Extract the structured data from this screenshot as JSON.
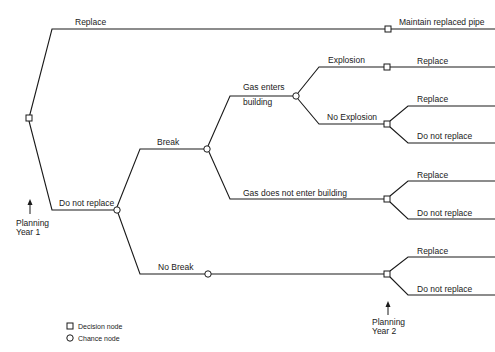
{
  "diagram": {
    "type": "decision-tree",
    "root": {
      "node_type": "decision",
      "branches": [
        {
          "label": "Replace",
          "outcome": {
            "node_type": "decision",
            "terminal_label": "Maintain replaced pipe"
          }
        },
        {
          "label": "Do not replace",
          "outcome": {
            "node_type": "chance",
            "branches": [
              {
                "label": "Break",
                "outcome": {
                  "node_type": "chance",
                  "branches": [
                    {
                      "label": "Gas enters building",
                      "outcome": {
                        "node_type": "chance",
                        "branches": [
                          {
                            "label": "Explosion",
                            "outcome": {
                              "node_type": "decision",
                              "options": [
                                "Replace"
                              ]
                            }
                          },
                          {
                            "label": "No Explosion",
                            "outcome": {
                              "node_type": "decision",
                              "options": [
                                "Replace",
                                "Do not replace"
                              ]
                            }
                          }
                        ]
                      }
                    },
                    {
                      "label": "Gas does not enter building",
                      "outcome": {
                        "node_type": "decision",
                        "options": [
                          "Replace",
                          "Do not replace"
                        ]
                      }
                    }
                  ]
                }
              },
              {
                "label": "No Break",
                "outcome": {
                  "node_type": "decision",
                  "options": [
                    "Replace",
                    "Do not replace"
                  ]
                }
              }
            ]
          }
        }
      ]
    }
  },
  "labels": {
    "replace_top": "Replace",
    "maintain": "Maintain replaced pipe",
    "do_not_replace": "Do not replace",
    "break": "Break",
    "gas_enters_1": "Gas enters",
    "gas_enters_2": "building",
    "explosion": "Explosion",
    "explosion_replace": "Replace",
    "no_explosion": "No Explosion",
    "no_explosion_replace": "Replace",
    "no_explosion_dnr": "Do not replace",
    "gas_not_enter": "Gas does not enter building",
    "gas_not_enter_replace": "Replace",
    "gas_not_enter_dnr": "Do not replace",
    "no_break": "No Break",
    "no_break_replace": "Replace",
    "no_break_dnr": "Do not replace"
  },
  "markers": {
    "year1_line1": "Planning",
    "year1_line2": "Year 1",
    "year2_line1": "Planning",
    "year2_line2": "Year 2"
  },
  "legend": {
    "decision": "Decision node",
    "chance": "Chance node"
  }
}
